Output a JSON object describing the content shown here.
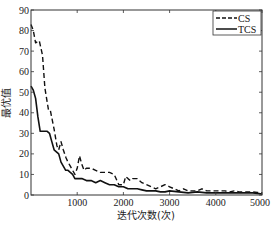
{
  "chart_data": {
    "type": "line",
    "title": "",
    "xlabel": "迭代次数(次)",
    "ylabel": "最优值",
    "xlim": [
      0,
      5000
    ],
    "ylim": [
      0,
      90
    ],
    "xticks": [
      1000,
      2000,
      3000,
      4000,
      5000
    ],
    "yticks": [
      0,
      10,
      20,
      30,
      40,
      50,
      60,
      70,
      80,
      90
    ],
    "grid": false,
    "legend_position": "upper right",
    "series": [
      {
        "name": "CS",
        "style": "dashed",
        "color": "#111111",
        "x": [
          0,
          50,
          100,
          180,
          250,
          300,
          380,
          420,
          500,
          560,
          600,
          650,
          700,
          760,
          800,
          850,
          900,
          950,
          1000,
          1050,
          1100,
          1150,
          1200,
          1300,
          1400,
          1500,
          1600,
          1700,
          1800,
          1900,
          2000,
          2050,
          2100,
          2150,
          2200,
          2300,
          2400,
          2500,
          2600,
          2700,
          2800,
          2900,
          3000,
          3100,
          3200,
          3300,
          3400,
          3500,
          3600,
          3700,
          3800,
          3900,
          4000,
          4100,
          4200,
          4300,
          4400,
          4500,
          4600,
          4700,
          4800,
          4900,
          5000
        ],
        "values": [
          83,
          80,
          74,
          75,
          68,
          52,
          41,
          41,
          32,
          24,
          22,
          26,
          22,
          18,
          16,
          14,
          12,
          10,
          13,
          19,
          15,
          12,
          13,
          13,
          12,
          11,
          11,
          11,
          10,
          5,
          5,
          9,
          8,
          7,
          8,
          8,
          6,
          5,
          4,
          3,
          4,
          5,
          4,
          3,
          2,
          3,
          2,
          2,
          2,
          3,
          2,
          2,
          2,
          2,
          2,
          1.5,
          2,
          1.5,
          1.5,
          1.5,
          1.5,
          1.2,
          1
        ]
      },
      {
        "name": "TCS",
        "style": "solid",
        "color": "#111111",
        "x": [
          0,
          50,
          100,
          150,
          200,
          250,
          300,
          350,
          400,
          450,
          500,
          550,
          600,
          650,
          700,
          750,
          800,
          850,
          900,
          950,
          1000,
          1100,
          1200,
          1300,
          1400,
          1500,
          1600,
          1700,
          1800,
          1900,
          2000,
          2100,
          2200,
          2300,
          2400,
          2500,
          2600,
          2700,
          2800,
          2900,
          3000,
          3200,
          3400,
          3600,
          3800,
          4000,
          4200,
          4400,
          4600,
          4800,
          4900,
          5000
        ],
        "values": [
          53,
          51,
          47,
          38,
          31,
          31,
          31,
          31,
          30,
          26,
          22,
          21,
          20,
          16,
          14,
          12,
          12,
          11,
          10,
          8,
          8,
          8,
          7,
          7,
          6,
          7,
          6,
          5,
          5,
          4,
          4,
          3,
          3,
          3,
          2.5,
          2,
          2,
          2,
          1.5,
          1.5,
          2,
          1.5,
          1,
          1.5,
          1,
          1,
          1,
          1,
          1,
          1,
          0.8,
          0.5
        ]
      }
    ]
  },
  "legend": {
    "items": [
      {
        "label": "CS"
      },
      {
        "label": "TCS"
      }
    ]
  },
  "axes": {
    "xlabel": "迭代次数(次)",
    "ylabel": "最优值"
  }
}
